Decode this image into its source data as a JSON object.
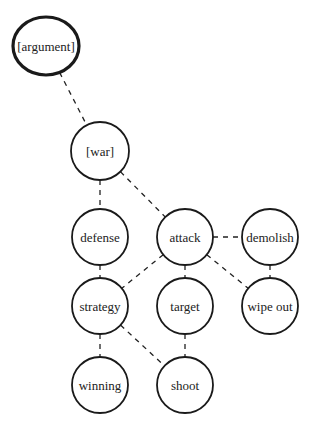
{
  "diagram": {
    "type": "concept-graph",
    "nodes": [
      {
        "id": "argument",
        "label": "[argument]",
        "cx": 46,
        "cy": 46,
        "rx": 33,
        "ry": 29,
        "root": true
      },
      {
        "id": "war",
        "label": "[war]",
        "cx": 100,
        "cy": 151,
        "rx": 29,
        "ry": 29
      },
      {
        "id": "defense",
        "label": "defense",
        "cx": 100,
        "cy": 237,
        "rx": 28,
        "ry": 28
      },
      {
        "id": "attack",
        "label": "attack",
        "cx": 185,
        "cy": 237,
        "rx": 28,
        "ry": 28
      },
      {
        "id": "demolish",
        "label": "demolish",
        "cx": 270,
        "cy": 237,
        "rx": 28,
        "ry": 28
      },
      {
        "id": "strategy",
        "label": "strategy",
        "cx": 100,
        "cy": 306,
        "rx": 28,
        "ry": 28
      },
      {
        "id": "target",
        "label": "target",
        "cx": 185,
        "cy": 306,
        "rx": 28,
        "ry": 28
      },
      {
        "id": "wipe_out",
        "label": "wipe out",
        "cx": 270,
        "cy": 306,
        "rx": 28,
        "ry": 28
      },
      {
        "id": "winning",
        "label": "winning",
        "cx": 100,
        "cy": 385,
        "rx": 28,
        "ry": 28
      },
      {
        "id": "shoot",
        "label": "shoot",
        "cx": 185,
        "cy": 385,
        "rx": 28,
        "ry": 28
      }
    ],
    "edges": [
      {
        "from": "argument",
        "to": "war"
      },
      {
        "from": "war",
        "to": "defense"
      },
      {
        "from": "war",
        "to": "attack"
      },
      {
        "from": "attack",
        "to": "demolish"
      },
      {
        "from": "attack",
        "to": "strategy"
      },
      {
        "from": "attack",
        "to": "target"
      },
      {
        "from": "attack",
        "to": "wipe_out"
      },
      {
        "from": "defense",
        "to": "strategy"
      },
      {
        "from": "demolish",
        "to": "wipe_out"
      },
      {
        "from": "strategy",
        "to": "winning"
      },
      {
        "from": "strategy",
        "to": "shoot"
      },
      {
        "from": "target",
        "to": "shoot"
      }
    ],
    "edge_style": "dashed",
    "stroke_color": "#1a1a1a",
    "background": "#ffffff"
  }
}
